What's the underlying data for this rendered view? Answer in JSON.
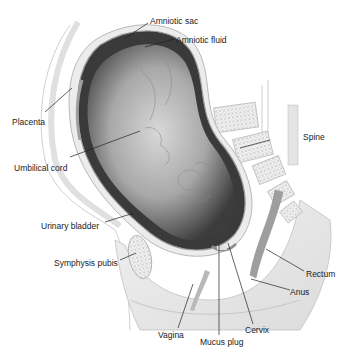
{
  "diagram": {
    "labels": {
      "amniotic_sac": "Amniotic sac",
      "amniotic_fluid": "Amniotic fluid",
      "placenta": "Placenta",
      "spine": "Spine",
      "umbilical_cord": "Umbilical cord",
      "urinary_bladder": "Urinary bladder",
      "symphysis_pubis": "Symphysis pubis",
      "rectum": "Rectum",
      "anus": "Anus",
      "vagina": "Vagina",
      "mucus_plug": "Mucus plug",
      "cervix": "Cervix"
    },
    "colors": {
      "background": "#ffffff",
      "tissue_light": "#e6e6e6",
      "tissue_mid": "#c8c8c8",
      "fetus_dark": "#3a3a3a",
      "fetus_light": "#cfcfcf",
      "leader_line": "#222222",
      "label_text": "#222222"
    }
  }
}
